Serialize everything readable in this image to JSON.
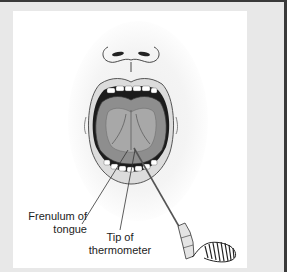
{
  "figure": {
    "labels": {
      "frenulum_line1": "Frenulum of",
      "frenulum_line2": "tongue",
      "tip_line1": "Tip of",
      "tip_line2": "thermometer"
    },
    "colors": {
      "frame_border": "#3a3a3a",
      "background": "#e8e8e8",
      "panel": "#ffffff",
      "mouth_dark": "#1a1a1a",
      "tongue": "#9a9a9a",
      "lips": "#d8d8d8"
    }
  }
}
